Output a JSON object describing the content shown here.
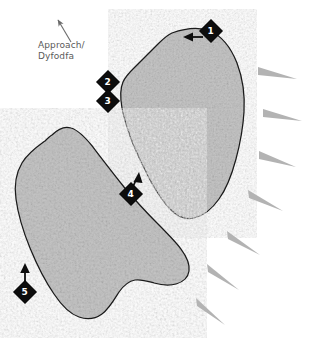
{
  "map": {
    "title": "Crag topo diagram",
    "background_color": "#ffffff",
    "outline_color": "#1a1a1a",
    "rock_fill_color": "#c6c6c6",
    "rock_texture_color": "#9e9e9e",
    "wedge_color": "#b0b0b0",
    "label_color": "#5a5a5a",
    "marker_fill_color": "#0d0d0d",
    "marker_text_color": "#ffffff"
  },
  "approach": {
    "label": "Approach/\nDyfodfa",
    "arrow_icon": "approach-arrow-icon",
    "arrow_direction": "up-left"
  },
  "markers": [
    {
      "id": "1",
      "label": "1",
      "x": 210,
      "y": 30,
      "has_arrow": true,
      "arrow_direction": "left"
    },
    {
      "id": "2",
      "label": "2",
      "x": 106,
      "y": 80,
      "has_arrow": false,
      "arrow_direction": ""
    },
    {
      "id": "3",
      "label": "3",
      "x": 106,
      "y": 98,
      "has_arrow": false,
      "arrow_direction": ""
    },
    {
      "id": "4",
      "label": "4",
      "x": 128,
      "y": 188,
      "has_arrow": true,
      "arrow_direction": "up-right"
    },
    {
      "id": "5",
      "label": "5",
      "x": 19,
      "y": 281,
      "has_arrow": true,
      "arrow_direction": "up"
    }
  ],
  "rock_masses": [
    {
      "name": "upper-crag",
      "id": "upper"
    },
    {
      "name": "lower-crag",
      "id": "lower"
    }
  ],
  "slope_wedges": [
    {
      "id": "w1",
      "x1": 258,
      "y1": 71,
      "x2": 297,
      "y2": 79,
      "thickness": 7
    },
    {
      "id": "w2",
      "x1": 263,
      "y1": 113,
      "x2": 302,
      "y2": 121,
      "thickness": 7
    },
    {
      "id": "w3",
      "x1": 259,
      "y1": 155,
      "x2": 296,
      "y2": 167,
      "thickness": 7
    },
    {
      "id": "w4",
      "x1": 248,
      "y1": 194,
      "x2": 283,
      "y2": 211,
      "thickness": 7
    },
    {
      "id": "w5",
      "x1": 226,
      "y1": 236,
      "x2": 260,
      "y2": 255,
      "thickness": 7
    },
    {
      "id": "w6",
      "x1": 206,
      "y1": 269,
      "x2": 239,
      "y2": 290,
      "thickness": 7
    },
    {
      "id": "w7",
      "x1": 195,
      "y1": 303,
      "x2": 225,
      "y2": 325,
      "thickness": 7
    }
  ]
}
